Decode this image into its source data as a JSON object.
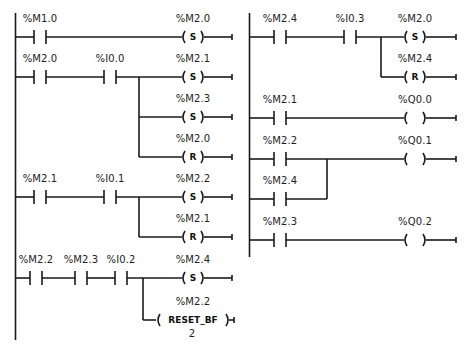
{
  "diagram": {
    "type": "ladder-logic",
    "networks_left": [
      {
        "rung": 1,
        "contacts": [
          {
            "address": "%M1.0",
            "type": "NO"
          }
        ],
        "coils": [
          {
            "address": "%M2.0",
            "type": "S",
            "symbol": "S"
          }
        ]
      },
      {
        "rung": 2,
        "contacts": [
          {
            "address": "%M2.0",
            "type": "NO"
          },
          {
            "address": "%I0.0",
            "type": "NO"
          }
        ],
        "coils": [
          {
            "address": "%M2.1",
            "type": "S",
            "symbol": "S"
          },
          {
            "address": "%M2.3",
            "type": "S",
            "symbol": "S"
          },
          {
            "address": "%M2.0",
            "type": "R",
            "symbol": "R"
          }
        ]
      },
      {
        "rung": 3,
        "contacts": [
          {
            "address": "%M2.1",
            "type": "NO"
          },
          {
            "address": "%I0.1",
            "type": "NO"
          }
        ],
        "coils": [
          {
            "address": "%M2.2",
            "type": "S",
            "symbol": "S"
          },
          {
            "address": "%M2.1",
            "type": "R",
            "symbol": "R"
          }
        ]
      },
      {
        "rung": 4,
        "contacts": [
          {
            "address": "%M2.2",
            "type": "NO"
          },
          {
            "address": "%M2.3",
            "type": "NO"
          },
          {
            "address": "%I0.2",
            "type": "NO"
          }
        ],
        "coils": [
          {
            "address": "%M2.4",
            "type": "S",
            "symbol": "S"
          },
          {
            "address": "%M2.2",
            "type": "RESET_BF",
            "symbol": "RESET_BF",
            "count": "2"
          }
        ]
      }
    ],
    "networks_right": [
      {
        "rung": 5,
        "contacts": [
          {
            "address": "%M2.4",
            "type": "NO"
          },
          {
            "address": "%I0.3",
            "type": "NO"
          }
        ],
        "coils": [
          {
            "address": "%M2.0",
            "type": "S",
            "symbol": "S"
          },
          {
            "address": "%M2.4",
            "type": "R",
            "symbol": "R"
          }
        ]
      },
      {
        "rung": 6,
        "contacts": [
          {
            "address": "%M2.1",
            "type": "NO"
          }
        ],
        "coils": [
          {
            "address": "%Q0.0",
            "type": "output",
            "symbol": ""
          }
        ]
      },
      {
        "rung": 7,
        "contacts": [
          {
            "address": "%M2.2",
            "type": "NO"
          }
        ],
        "parallel_contacts": [
          {
            "address": "%M2.4",
            "type": "NO"
          }
        ],
        "coils": [
          {
            "address": "%Q0.1",
            "type": "output",
            "symbol": ""
          }
        ]
      },
      {
        "rung": 8,
        "contacts": [
          {
            "address": "%M2.3",
            "type": "NO"
          }
        ],
        "coils": [
          {
            "address": "%Q0.2",
            "type": "output",
            "symbol": ""
          }
        ]
      }
    ]
  },
  "labels": {
    "r1_c1": "%M1.0",
    "r1_coil1": "%M2.0",
    "r2_c1": "%M2.0",
    "r2_c2": "%I0.0",
    "r2_coil1": "%M2.1",
    "r2_coil2": "%M2.3",
    "r2_coil3": "%M2.0",
    "r3_c1": "%M2.1",
    "r3_c2": "%I0.1",
    "r3_coil1": "%M2.2",
    "r3_coil2": "%M2.1",
    "r4_c1": "%M2.2",
    "r4_c2": "%M2.3",
    "r4_c3": "%I0.2",
    "r4_coil1": "%M2.4",
    "r4_coil2": "%M2.2",
    "r5_c1": "%M2.4",
    "r5_c2": "%I0.3",
    "r5_coil1": "%M2.0",
    "r5_coil2": "%M2.4",
    "r6_c1": "%M2.1",
    "r6_coil1": "%Q0.0",
    "r7_c1": "%M2.2",
    "r7_c2": "%M2.4",
    "r7_coil1": "%Q0.1",
    "r8_c1": "%M2.3",
    "r8_coil1": "%Q0.2"
  },
  "coil_symbols": {
    "set": "S",
    "reset": "R",
    "reset_bf": "RESET_BF",
    "reset_bf_count": "2"
  }
}
